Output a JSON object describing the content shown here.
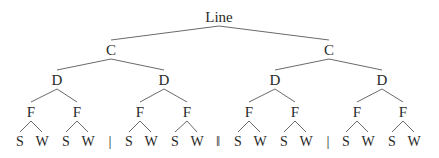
{
  "diagram": {
    "type": "tree",
    "root": {
      "label": "Line",
      "x": 219,
      "y": 22
    },
    "level1": [
      {
        "label": "C",
        "x": 111,
        "y": 55
      },
      {
        "label": "C",
        "x": 329,
        "y": 55
      }
    ],
    "level2": [
      {
        "label": "D",
        "x": 57,
        "y": 85,
        "parent": 0
      },
      {
        "label": "D",
        "x": 164,
        "y": 85,
        "parent": 0
      },
      {
        "label": "D",
        "x": 275,
        "y": 85,
        "parent": 1
      },
      {
        "label": "D",
        "x": 382,
        "y": 85,
        "parent": 1
      }
    ],
    "level3": [
      {
        "label": "F",
        "x": 31,
        "y": 117,
        "parent": 0
      },
      {
        "label": "F",
        "x": 77,
        "y": 117,
        "parent": 0
      },
      {
        "label": "F",
        "x": 140,
        "y": 117,
        "parent": 1
      },
      {
        "label": "F",
        "x": 187,
        "y": 117,
        "parent": 1
      },
      {
        "label": "F",
        "x": 249,
        "y": 117,
        "parent": 2
      },
      {
        "label": "F",
        "x": 295,
        "y": 117,
        "parent": 2
      },
      {
        "label": "F",
        "x": 357,
        "y": 117,
        "parent": 3
      },
      {
        "label": "F",
        "x": 403,
        "y": 117,
        "parent": 3
      }
    ],
    "leaves": [
      {
        "label": "S",
        "x": 20,
        "y": 146,
        "parent": 0
      },
      {
        "label": "W",
        "x": 42,
        "y": 146,
        "parent": 0
      },
      {
        "label": "S",
        "x": 66,
        "y": 146,
        "parent": 1
      },
      {
        "label": "W",
        "x": 88,
        "y": 146,
        "parent": 1
      },
      {
        "label": "S",
        "x": 129,
        "y": 146,
        "parent": 2
      },
      {
        "label": "W",
        "x": 151,
        "y": 146,
        "parent": 2
      },
      {
        "label": "S",
        "x": 175,
        "y": 146,
        "parent": 3
      },
      {
        "label": "W",
        "x": 197,
        "y": 146,
        "parent": 3
      },
      {
        "label": "S",
        "x": 238,
        "y": 146,
        "parent": 4
      },
      {
        "label": "W",
        "x": 260,
        "y": 146,
        "parent": 4
      },
      {
        "label": "S",
        "x": 284,
        "y": 146,
        "parent": 5
      },
      {
        "label": "W",
        "x": 306,
        "y": 146,
        "parent": 5
      },
      {
        "label": "S",
        "x": 346,
        "y": 146,
        "parent": 6
      },
      {
        "label": "W",
        "x": 368,
        "y": 146,
        "parent": 6
      },
      {
        "label": "S",
        "x": 392,
        "y": 146,
        "parent": 7
      },
      {
        "label": "W",
        "x": 414,
        "y": 146,
        "parent": 7
      }
    ],
    "separators": [
      {
        "label": "|",
        "x": 110,
        "y": 146
      },
      {
        "label": "‖",
        "x": 218,
        "y": 146
      },
      {
        "label": "|",
        "x": 328,
        "y": 146
      }
    ]
  }
}
